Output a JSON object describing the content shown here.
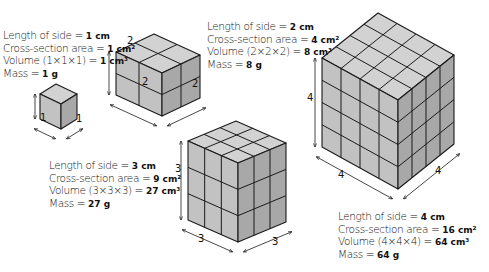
{
  "colors": {
    "top_face": "#d2d2d2",
    "left_face": "#c2c2c2",
    "right_face": "#a8a8a8",
    "edge": "#1a1a1a",
    "background": "#ffffff"
  },
  "cubes": [
    {
      "id": "cube-1",
      "side_cm": 1,
      "lines": {
        "length": "Length of side = ",
        "length_val": "1 cm",
        "area": "Cross-section area = ",
        "area_val": "1 cm²",
        "volume": "Volume (1×1×1) = ",
        "volume_val": "1 cm³",
        "mass": "Mass = ",
        "mass_val": "1 g"
      },
      "dims": {
        "height": "1",
        "left": "1",
        "right": "1"
      }
    },
    {
      "id": "cube-2",
      "side_cm": 2,
      "lines": {
        "length": "Length of side = ",
        "length_val": "2 cm",
        "area": "Cross-section area = ",
        "area_val": "4 cm²",
        "volume": "Volume (2×2×2) = ",
        "volume_val": "8 cm³",
        "mass": "Mass = ",
        "mass_val": "8 g"
      },
      "dims": {
        "height": "2",
        "left": "2",
        "right": "2"
      }
    },
    {
      "id": "cube-3",
      "side_cm": 3,
      "lines": {
        "length": "Length of side = ",
        "length_val": "3 cm",
        "area": "Cross-section area = ",
        "area_val": "9 cm²",
        "volume": "Volume (3×3×3) = ",
        "volume_val": "27 cm³",
        "mass": "Mass = ",
        "mass_val": "27 g"
      },
      "dims": {
        "height": "3",
        "left": "3",
        "right": "3"
      }
    },
    {
      "id": "cube-4",
      "side_cm": 4,
      "lines": {
        "length": "Length of side = ",
        "length_val": "4 cm",
        "area": "Cross-section area = ",
        "area_val": "16 cm²",
        "volume": "Volume (4×4×4) = ",
        "volume_val": "64 cm³",
        "mass": "Mass = ",
        "mass_val": "64 g"
      },
      "dims": {
        "height": "4",
        "left": "4",
        "right": "4"
      }
    }
  ]
}
